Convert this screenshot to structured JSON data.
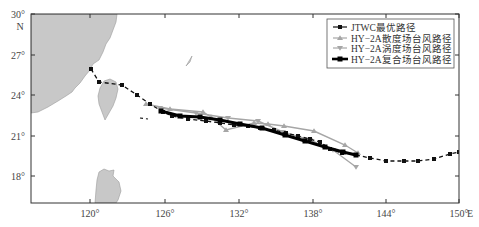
{
  "map": {
    "frame": {
      "left": 31,
      "top": 14,
      "right": 459,
      "bottom": 203
    },
    "colors": {
      "land": "#c8c8c8",
      "land_stroke": "#9a9a9a",
      "frame": "#333333",
      "jtwc": "#111111",
      "scatterometer": "#a6a6a6",
      "radiometer": "#a6a6a6",
      "composite": "#000000"
    },
    "y_axis": {
      "ticks": [
        {
          "label": "30°",
          "y": 14
        },
        {
          "label": "27°",
          "y": 55
        },
        {
          "label": "24°",
          "y": 95
        },
        {
          "label": "21°",
          "y": 136
        },
        {
          "label": "18°",
          "y": 176
        }
      ],
      "unit_label": "N"
    },
    "x_axis": {
      "ticks": [
        {
          "label": "120°",
          "x": 90
        },
        {
          "label": "126°",
          "x": 165
        },
        {
          "label": "132°",
          "x": 239
        },
        {
          "label": "138°",
          "x": 313
        },
        {
          "label": "144°",
          "x": 386
        },
        {
          "label": "150°",
          "x": 459
        }
      ],
      "unit_label": "E"
    },
    "legend": {
      "items": [
        {
          "label": "JTWC最优路径",
          "style": "jtwc"
        },
        {
          "label": "HY−2A散度场台风路径",
          "style": "scatterometer"
        },
        {
          "label": "HY−2A涡度场台风路径",
          "style": "radiometer"
        },
        {
          "label": "HY−2A复合场台风路径",
          "style": "composite"
        }
      ]
    },
    "land": {
      "mainland": "M31,14 L117,14 L116,22 L113,30 L110,38 L106,44 L103,52 L99,60 L93,64 L90,70 L85,76 L80,83 L75,88 L72,92 L66,96 L58,101 L48,107 L38,112 L31,113 Z",
      "taiwan": "M104,81 L110,79 L116,82 L118,89 L116,98 L113,106 L109,113 L105,120 L102,112 L99,104 L98,96 L100,88 Z",
      "luzon": "M99,172 L104,169 L109,171 L114,170 L113,176 L119,182 L121,191 L118,200 L116,203 L95,203 L96,190 L97,180 Z",
      "small_island": "M186,66 L189,61 L192,56 L190,62 Z"
    },
    "tracks": {
      "jtwc": {
        "points": [
          [
            91,
            69
          ],
          [
            99,
            82
          ],
          [
            122,
            85
          ],
          [
            137,
            95
          ],
          [
            150,
            104
          ],
          [
            163,
            112
          ],
          [
            172,
            116
          ],
          [
            188,
            119
          ],
          [
            206,
            121
          ],
          [
            220,
            123
          ],
          [
            234,
            125
          ],
          [
            248,
            126
          ],
          [
            260,
            128
          ],
          [
            274,
            130
          ],
          [
            286,
            133
          ],
          [
            298,
            136
          ],
          [
            310,
            139
          ],
          [
            320,
            142
          ],
          [
            330,
            149
          ],
          [
            342,
            153
          ],
          [
            356,
            155
          ],
          [
            370,
            158
          ],
          [
            386,
            161
          ],
          [
            404,
            161
          ],
          [
            418,
            161
          ],
          [
            434,
            159
          ],
          [
            450,
            154
          ],
          [
            459,
            152
          ]
        ],
        "lonlat": [
          [
            121.2,
            26.0
          ],
          [
            121.9,
            25.1
          ],
          [
            123.7,
            24.8
          ],
          [
            125.0,
            24.1
          ],
          [
            126.1,
            23.4
          ],
          [
            127.1,
            22.8
          ],
          [
            127.8,
            22.5
          ],
          [
            129.1,
            22.3
          ],
          [
            130.6,
            22.1
          ],
          [
            131.7,
            22.0
          ],
          [
            132.9,
            21.8
          ],
          [
            134.0,
            21.8
          ],
          [
            135.0,
            21.6
          ],
          [
            136.1,
            21.5
          ],
          [
            137.1,
            21.3
          ],
          [
            138.1,
            21.0
          ],
          [
            139.1,
            20.8
          ],
          [
            139.9,
            20.6
          ],
          [
            140.7,
            20.1
          ],
          [
            141.7,
            19.8
          ],
          [
            142.9,
            19.6
          ],
          [
            144.0,
            19.4
          ],
          [
            145.3,
            19.2
          ],
          [
            146.8,
            19.2
          ],
          [
            147.9,
            19.2
          ],
          [
            149.2,
            19.4
          ],
          [
            150.5,
            19.7
          ],
          [
            151.2,
            19.9
          ]
        ]
      },
      "scatterometer": {
        "points": [
          [
            146,
            104
          ],
          [
            170,
            109
          ],
          [
            203,
            112
          ],
          [
            211,
            117
          ],
          [
            226,
            130
          ],
          [
            254,
            123
          ],
          [
            268,
            124
          ],
          [
            284,
            126
          ],
          [
            314,
            131
          ],
          [
            345,
            145
          ],
          [
            358,
            153
          ]
        ],
        "lonlat": [
          [
            125.7,
            23.5
          ],
          [
            127.6,
            23.1
          ],
          [
            130.4,
            22.9
          ],
          [
            131.0,
            22.5
          ],
          [
            132.2,
            21.5
          ],
          [
            134.5,
            22.1
          ],
          [
            135.7,
            22.0
          ],
          [
            137.0,
            21.8
          ],
          [
            139.4,
            21.4
          ],
          [
            142.0,
            20.4
          ],
          [
            143.0,
            19.8
          ]
        ]
      },
      "radiometer": {
        "points": [
          [
            160,
            108
          ],
          [
            196,
            113
          ],
          [
            228,
            118
          ],
          [
            258,
            121
          ],
          [
            283,
            132
          ],
          [
            310,
            140
          ],
          [
            333,
            150
          ],
          [
            356,
            167
          ]
        ],
        "lonlat": [
          [
            126.8,
            23.2
          ],
          [
            129.8,
            22.8
          ],
          [
            132.4,
            22.4
          ],
          [
            134.8,
            22.2
          ],
          [
            136.9,
            21.4
          ],
          [
            139.1,
            20.8
          ],
          [
            140.9,
            20.0
          ],
          [
            142.8,
            18.8
          ]
        ]
      },
      "composite": {
        "points": [
          [
            161,
            111
          ],
          [
            180,
            116
          ],
          [
            200,
            117
          ],
          [
            220,
            120
          ],
          [
            240,
            124
          ],
          [
            262,
            128
          ],
          [
            285,
            135
          ],
          [
            305,
            141
          ],
          [
            325,
            147
          ],
          [
            343,
            152
          ],
          [
            356,
            155
          ]
        ],
        "lonlat": [
          [
            126.9,
            22.9
          ],
          [
            128.5,
            22.6
          ],
          [
            130.1,
            22.5
          ],
          [
            131.8,
            22.3
          ],
          [
            133.4,
            22.0
          ],
          [
            135.2,
            21.7
          ],
          [
            137.1,
            21.2
          ],
          [
            138.7,
            20.8
          ],
          [
            140.3,
            20.3
          ],
          [
            141.8,
            20.0
          ],
          [
            142.9,
            19.8
          ]
        ]
      }
    },
    "stray_segment": {
      "points": [
        [
          140,
          118
        ],
        [
          148,
          119
        ]
      ]
    }
  }
}
